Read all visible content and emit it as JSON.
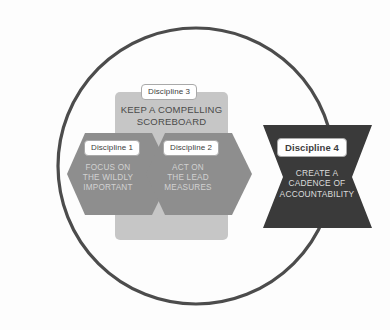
{
  "diagram": {
    "shapes": {
      "circle": {
        "name": "outer-circle",
        "stroke": "#4c4c4c",
        "stroke_width": 3.2,
        "cx": 196,
        "cy": 166,
        "r": 138
      },
      "panel_d3": {
        "name": "discipline-3-panel",
        "fill": "#c6c6c6",
        "x": 115,
        "y": 92,
        "width": 113,
        "height": 148,
        "radius": 5
      },
      "arrow_d1": {
        "name": "discipline-1-arrow",
        "fill": "#8e8e8e"
      },
      "arrow_d2": {
        "name": "discipline-2-arrow",
        "fill": "#8e8e8e"
      },
      "banner_d4": {
        "name": "discipline-4-banner",
        "fill": "#3a3a3a"
      }
    }
  },
  "disciplines": [
    {
      "id": "discipline-1",
      "label": "Discipline 1",
      "body": "FOCUS ON\nTHE WILDLY\nIMPORTANT",
      "color": "#8e8e8e",
      "text_color": "#d2d2d2"
    },
    {
      "id": "discipline-2",
      "label": "Discipline 2",
      "body": "ACT ON\nTHE LEAD\nMEASURES",
      "color": "#8e8e8e",
      "text_color": "#d2d2d2"
    },
    {
      "id": "discipline-3",
      "label": "Discipline 3",
      "body": "KEEP A COMPELLING\nSCOREBOARD",
      "color": "#c6c6c6",
      "text_color": "#4a4a4a"
    },
    {
      "id": "discipline-4",
      "label": "Discipline 4",
      "body": "CREATE A\nCADENCE OF\nACCOUNTABILITY",
      "color": "#3a3a3a",
      "text_color": "#dcdcdc"
    }
  ]
}
